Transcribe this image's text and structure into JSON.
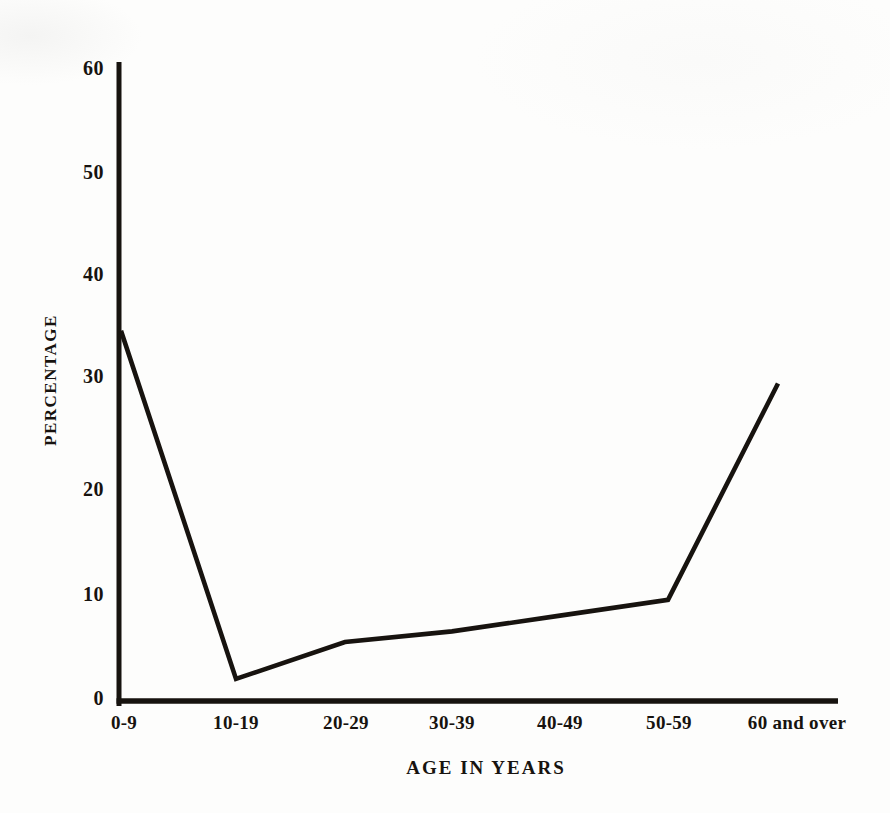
{
  "chart_data": {
    "type": "line",
    "title": "",
    "xlabel": "AGE IN YEARS",
    "ylabel": "PERCENTAGE",
    "categories": [
      "0-9",
      "10-19",
      "20-29",
      "30-39",
      "40-49",
      "50-59",
      "60 and over"
    ],
    "series": [
      {
        "name": "Percentage",
        "values": [
          35,
          2,
          5.5,
          6.5,
          8,
          9.5,
          30
        ]
      }
    ],
    "yticks": [
      0,
      10,
      20,
      30,
      40,
      50,
      60
    ],
    "ylim": [
      0,
      60
    ],
    "grid": false,
    "legend": "none",
    "line_color": "#17130f",
    "axis_color": "#17130f",
    "background": "#fdfdfc"
  }
}
